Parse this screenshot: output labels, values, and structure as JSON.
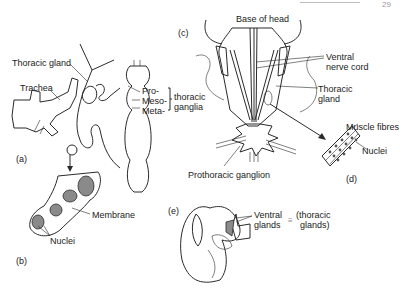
{
  "page": {
    "page_number": "29"
  },
  "panels": {
    "a": {
      "tag": "(a)",
      "labels": {
        "thoracic_gland": "Thoracic gland",
        "trachea": "Trachea",
        "pro": "Pro-",
        "meso": "Meso-",
        "meta": "Meta-",
        "thoracic": "thoracic",
        "ganglia": "ganglia"
      }
    },
    "b": {
      "tag": "(b)",
      "labels": {
        "membrane": "Membrane",
        "nuclei": "Nuclei"
      }
    },
    "c": {
      "tag": "(c)",
      "labels": {
        "base_of_head": "Base of head",
        "ventral_nerve_cord_1": "Ventral",
        "ventral_nerve_cord_2": "nerve cord",
        "thoracic_gland_1": "Thoracic",
        "thoracic_gland_2": "gland",
        "prothoracic_ganglion": "Prothoracic ganglion"
      }
    },
    "d": {
      "tag": "(d)",
      "labels": {
        "muscle_fibres": "Muscle fibres",
        "nuclei": "Nuclei"
      }
    },
    "e": {
      "tag": "(e)",
      "labels": {
        "ventral": "Ventral",
        "glands": "glands",
        "equiv": "≡",
        "thoracic": "(thoracic",
        "glands2": "glands)"
      }
    }
  }
}
